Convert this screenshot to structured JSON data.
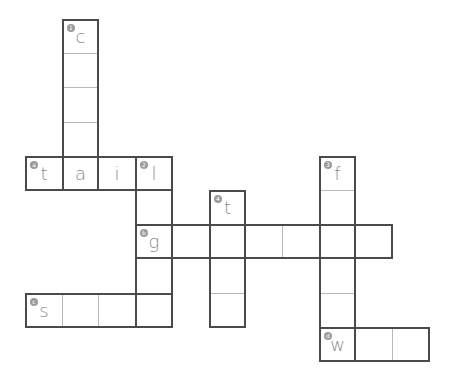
{
  "puzzle": {
    "type": "crossword",
    "cell_width": 36.7,
    "cell_height": 34.2,
    "origin": {
      "x": 25,
      "y": 19
    },
    "colors": {
      "border": "#4a4a4a",
      "inner_line": "#b8b8b8",
      "letter": "#8a8a8a",
      "badge": "#9a9a9a"
    },
    "words": [
      {
        "id": "1",
        "badge": "1",
        "direction": "down",
        "row": 0,
        "col": 1,
        "length": 5,
        "letters": [
          "c",
          "",
          "",
          "",
          ""
        ]
      },
      {
        "id": "a",
        "badge": "a",
        "direction": "across",
        "row": 4,
        "col": 0,
        "length": 4,
        "letters": [
          "t",
          "a",
          "i",
          "l"
        ]
      },
      {
        "id": "2",
        "badge": "2",
        "direction": "down",
        "row": 4,
        "col": 3,
        "length": 5,
        "letters": [
          "l",
          "",
          "g",
          "",
          ""
        ]
      },
      {
        "id": "3",
        "badge": "3",
        "direction": "down",
        "row": 4,
        "col": 8,
        "length": 6,
        "letters": [
          "f",
          "",
          "",
          "",
          "",
          ""
        ]
      },
      {
        "id": "4",
        "badge": "4",
        "direction": "down",
        "row": 5,
        "col": 5,
        "length": 4,
        "letters": [
          "t",
          "",
          "",
          ""
        ]
      },
      {
        "id": "b",
        "badge": "b",
        "direction": "across",
        "row": 6,
        "col": 3,
        "length": 7,
        "letters": [
          "g",
          "",
          "",
          "",
          "",
          "",
          ""
        ]
      },
      {
        "id": "c",
        "badge": "c",
        "direction": "across",
        "row": 8,
        "col": 0,
        "length": 4,
        "letters": [
          "s",
          "",
          "",
          ""
        ]
      },
      {
        "id": "d",
        "badge": "d",
        "direction": "across",
        "row": 9,
        "col": 8,
        "length": 3,
        "letters": [
          "w",
          "",
          ""
        ]
      }
    ]
  }
}
